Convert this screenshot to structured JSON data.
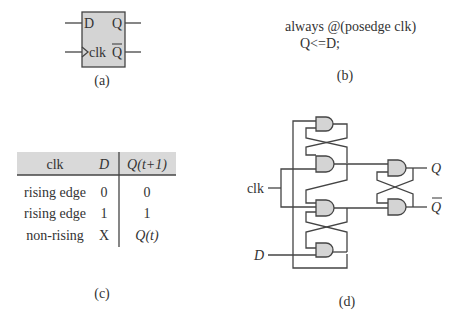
{
  "panel_a": {
    "caption": "(a)",
    "ports": {
      "d": "D",
      "q": "Q",
      "clk": "clk",
      "qbar": "Q"
    },
    "box_fill": "#d4d4d4"
  },
  "panel_b": {
    "caption": "(b)",
    "code_lines": [
      "always @(posedge clk)",
      "Q<=D;"
    ]
  },
  "panel_c": {
    "caption": "(c)",
    "header": {
      "clk": "clk",
      "d": "D",
      "q_next": "Q(t+1)"
    },
    "rows": [
      {
        "clk": "rising edge",
        "d": "0",
        "q_next": "0"
      },
      {
        "clk": "rising edge",
        "d": "1",
        "q_next": "1"
      },
      {
        "clk": "non-rising",
        "d": "X",
        "q_next": "Q(t)"
      }
    ],
    "header_fill": "#d9d9d9"
  },
  "panel_d": {
    "caption": "(d)",
    "inputs": {
      "clk": "clk",
      "d": "D"
    },
    "outputs": {
      "q": "Q",
      "qbar": "Q"
    },
    "gate_fill": "#d4d4d4"
  }
}
